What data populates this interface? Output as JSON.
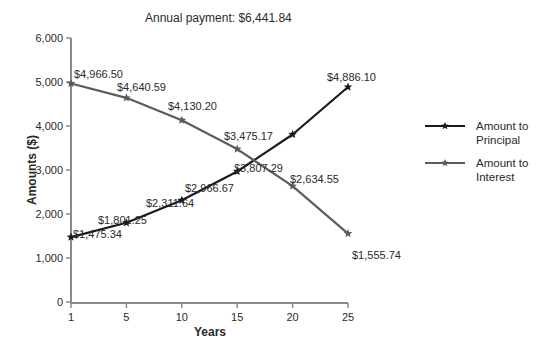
{
  "chart_data": {
    "type": "line",
    "title": "Annual payment: $6,441.84",
    "xlabel": "Years",
    "ylabel": "Amounts ($)",
    "categories": [
      "1",
      "5",
      "10",
      "15",
      "20",
      "25"
    ],
    "ylim": [
      0,
      6000
    ],
    "yticks": [
      0,
      1000,
      2000,
      3000,
      4000,
      5000,
      6000
    ],
    "ytick_labels": [
      "0",
      "1,000",
      "2,000",
      "3,000",
      "4,000",
      "5,000",
      "6,000"
    ],
    "grid": false,
    "legend_position": "right",
    "series": [
      {
        "name": "Amount to Principal",
        "legend_lines": [
          "Amount to",
          "Principal"
        ],
        "color": "#1a1a1a",
        "marker": "star",
        "values": [
          1475.34,
          1801.25,
          2311.64,
          2966.67,
          3807.29,
          4886.1
        ],
        "labels": [
          "$1,475.34",
          "$1,801.25",
          "$2,311.64",
          "$2,966.67",
          "$3,807.29",
          "$4,886.10"
        ]
      },
      {
        "name": "Amount to Interest",
        "legend_lines": [
          "Amount to",
          "Interest"
        ],
        "color": "#5c5c5c",
        "marker": "star",
        "values": [
          4966.5,
          4640.59,
          4130.2,
          3475.17,
          2634.55,
          1555.74
        ],
        "labels": [
          "$4,966.50",
          "$4,640.59",
          "$4,130.20",
          "$3,475.17",
          "$2,634.55",
          "$1,555.74"
        ]
      }
    ]
  }
}
